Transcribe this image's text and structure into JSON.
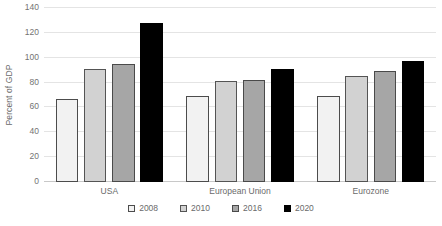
{
  "chart_data": {
    "type": "bar",
    "title": "",
    "subtitle": "",
    "xlabel": "",
    "ylabel": "Percent of GDP",
    "categories": [
      "USA",
      "European Union",
      "Eurozone"
    ],
    "series": [
      {
        "name": "2008",
        "color": "#f2f2f2",
        "border": "#4c4c4c",
        "values": [
          67,
          69,
          69
        ]
      },
      {
        "name": "2010",
        "color": "#d2d2d2",
        "border": "#545454",
        "values": [
          91,
          81,
          85
        ]
      },
      {
        "name": "2016",
        "color": "#a6a6a6",
        "border": "#4a4a4a",
        "values": [
          95,
          82,
          89
        ]
      },
      {
        "name": "2020",
        "color": "#000000",
        "border": "#000000",
        "values": [
          128,
          91,
          97
        ]
      }
    ],
    "ylim": [
      0,
      140
    ],
    "ytick_step": 20,
    "yticks": [
      0,
      20,
      40,
      60,
      80,
      100,
      120,
      140
    ],
    "ytick_labels": [
      "0",
      "20",
      "40",
      "60",
      "80",
      "100",
      "120",
      "140"
    ],
    "grid": true,
    "grid_axis": "y",
    "legend_position": "bottom",
    "legend_orientation": "horizontal",
    "background_color": "#ffffff",
    "gridline_color": "#e4e4e4"
  }
}
